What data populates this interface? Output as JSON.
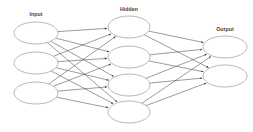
{
  "diagram": {
    "background_color": "#ffffff",
    "node_stroke_color": "#9a9a9a",
    "node_fill_color": "#ffffff",
    "edge_color": "#4a4a4a",
    "label_color": "#3d3d3d",
    "layers": [
      {
        "id": "input",
        "label": "Input",
        "label_x": 36,
        "label_y": 16,
        "node_count": 3,
        "rx": 22,
        "ry": 11,
        "cx": 36,
        "node_centers_y": [
          33,
          63,
          93
        ]
      },
      {
        "id": "hidden",
        "label": "Hidden",
        "label_x": 129,
        "label_y": 11,
        "node_count": 4,
        "rx": 21,
        "ry": 11,
        "cx": 129,
        "node_centers_y": [
          27,
          57,
          85,
          112
        ]
      },
      {
        "id": "output",
        "label": "Output",
        "label_x": 225,
        "label_y": 31,
        "node_count": 2,
        "rx": 22,
        "ry": 11,
        "cx": 225,
        "node_centers_y": [
          47,
          76
        ]
      }
    ],
    "connections": {
      "input_to_hidden": "fully-connected",
      "hidden_to_output": "fully-connected",
      "arrow_direction": "left-to-right",
      "input_to_hidden_count": 12,
      "hidden_to_output_count": 8
    }
  }
}
